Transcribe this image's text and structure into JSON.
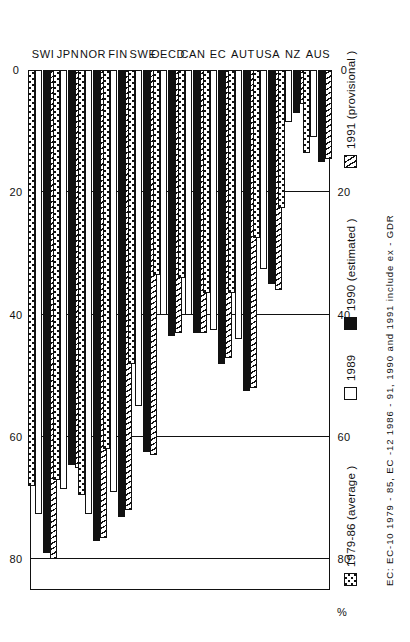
{
  "chart_data": {
    "type": "bar",
    "orientation": "horizontal-rotated",
    "title": "",
    "xlabel": "",
    "ylabel": "%",
    "ylim": [
      0,
      85
    ],
    "ticks": [
      0,
      20,
      40,
      60,
      80
    ],
    "grid": true,
    "legend_position": "bottom-left",
    "categories": [
      "SWI",
      "JPN",
      "NOR",
      "FIN",
      "SWE",
      "OECD",
      "CAN",
      "EC",
      "AUT",
      "USA",
      "NZ",
      "AUS"
    ],
    "series": [
      {
        "name": "1979-86 (average)",
        "pattern": "dotted",
        "values": [
          68.0,
          67.0,
          69.5,
          62.0,
          48.0,
          33.5,
          34.0,
          36.5,
          36.5,
          27.5,
          22.5,
          13.5
        ]
      },
      {
        "name": "1989",
        "pattern": "white",
        "values": [
          72.5,
          68.5,
          72.5,
          69.0,
          55.0,
          40.0,
          40.0,
          42.5,
          44.0,
          32.5,
          8.5,
          11.0
        ]
      },
      {
        "name": "1990 (estimated)",
        "pattern": "black",
        "values": [
          79.0,
          64.5,
          77.0,
          73.0,
          62.5,
          43.5,
          43.0,
          48.0,
          52.5,
          35.0,
          7.0,
          15.0
        ]
      },
      {
        "name": "1991 (provisional )",
        "pattern": "hatch",
        "values": [
          80.0,
          65.0,
          76.5,
          72.0,
          63.0,
          43.0,
          43.0,
          47.0,
          52.0,
          36.0,
          5.5,
          14.5
        ]
      }
    ],
    "footnote": "EC: EC-10 1979 - 85, EC -12 1986 - 91, 1990 and 1991 include ex - GDR"
  },
  "axis": {
    "unit_label": "%",
    "tick_labels": [
      "0",
      "20",
      "40",
      "60",
      "80"
    ]
  },
  "legend": {
    "items": [
      {
        "label": "1979-86 (average )",
        "pattern": "dotted"
      },
      {
        "label": "1989",
        "pattern": "white"
      },
      {
        "label": "1990 (estimated )",
        "pattern": "black"
      },
      {
        "label": "1991 (provisional )",
        "pattern": "hatch"
      }
    ],
    "footnote": "EC: EC-10 1979 - 85, EC -12 1986 - 91, 1990 and 1991 include ex - GDR"
  }
}
